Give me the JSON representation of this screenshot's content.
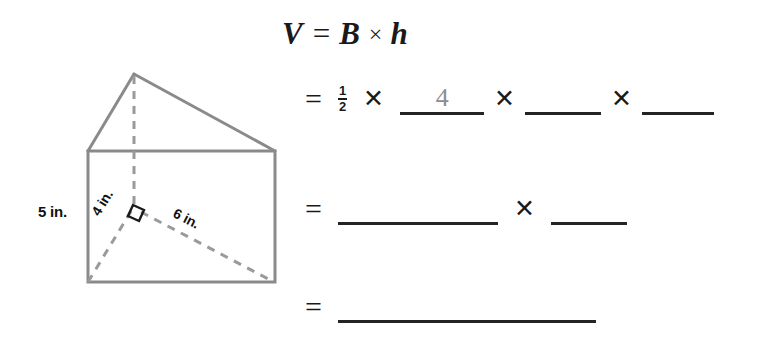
{
  "page": {
    "background_color": "#ffffff"
  },
  "figure": {
    "name": "triangular-prism",
    "outline_color": "#8a8a8a",
    "dashed_color": "#9a9a9a",
    "right_angle_marker": true,
    "labels": [
      {
        "text": "5 in.",
        "edge": "prism-height-left"
      },
      {
        "text": "4 in.",
        "edge": "triangle-base-left"
      },
      {
        "text": "6 in.",
        "edge": "triangle-base-right"
      }
    ],
    "label_5in": "5 in.",
    "label_4in": "4 in.",
    "label_6in": "6 in."
  },
  "equation": {
    "line1": {
      "v": "V",
      "equals": "=",
      "b": "B",
      "times": "×",
      "h": "h"
    },
    "line2": {
      "equals": "=",
      "fraction_numerator": "1",
      "fraction_denominator": "2",
      "times1": "✕",
      "blank1_value": "4",
      "times2": "✕",
      "blank2_value": "",
      "times3": "✕",
      "blank3_value": ""
    },
    "line3": {
      "equals": "=",
      "blank1_value": "",
      "times": "✕",
      "blank2_value": ""
    },
    "line4": {
      "equals": "=",
      "blank1_value": ""
    }
  },
  "colors": {
    "ink": "#1a1a1a",
    "blank_rule": "#242424",
    "pencil_answer": "#8d8d8d",
    "figure_line": "#8a8a8a"
  }
}
